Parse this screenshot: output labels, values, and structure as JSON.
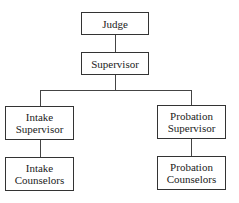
{
  "diagram": {
    "type": "org-chart",
    "nodes": {
      "judge": {
        "label": "Judge"
      },
      "supervisor": {
        "label": "Supervisor"
      },
      "intake_supervisor": {
        "label": "Intake\nSupervisor",
        "line1": "Intake",
        "line2": "Supervisor"
      },
      "probation_supervisor": {
        "label": "Probation\nSupervisor",
        "line1": "Probation",
        "line2": "Supervisor"
      },
      "intake_counselors": {
        "label": "Intake\nCounselors",
        "line1": "Intake",
        "line2": "Counselors"
      },
      "probation_counselors": {
        "label": "Probation\nCounselors",
        "line1": "Probation",
        "line2": "Counselors"
      }
    },
    "edges": [
      [
        "judge",
        "supervisor"
      ],
      [
        "supervisor",
        "intake_supervisor"
      ],
      [
        "supervisor",
        "probation_supervisor"
      ],
      [
        "intake_supervisor",
        "intake_counselors"
      ],
      [
        "probation_supervisor",
        "probation_counselors"
      ]
    ]
  }
}
